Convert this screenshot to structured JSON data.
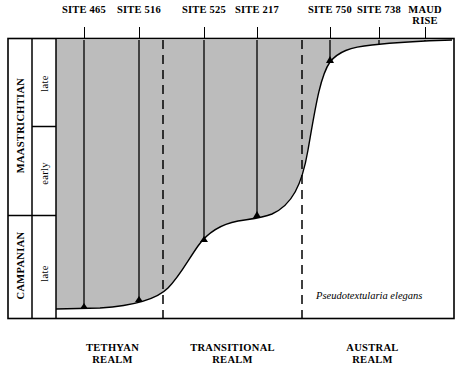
{
  "figure": {
    "sites": [
      {
        "label": "SITE\n465",
        "x": 84,
        "tick_x": 84
      },
      {
        "label": "SITE\n516",
        "x": 139,
        "tick_x": 139
      },
      {
        "label": "SITE\n525",
        "x": 204,
        "tick_x": 204
      },
      {
        "label": "SITE\n217",
        "x": 257,
        "tick_x": 257
      },
      {
        "label": "SITE\n750",
        "x": 330,
        "tick_x": 330
      },
      {
        "label": "SITE\n738",
        "x": 379,
        "tick_x": 379
      },
      {
        "label": "MAUD\nRISE",
        "x": 425,
        "tick_x": 425
      }
    ],
    "site_labels_flat": [
      "SITE 465",
      "SITE 516",
      "SITE 525",
      "SITE 217",
      "SITE 750",
      "SITE 738",
      "MAUD RISE"
    ],
    "stages": [
      {
        "name": "MAASTRICHTIAN",
        "substages": [
          "late",
          "early"
        ]
      },
      {
        "name": "CAMPANIAN",
        "substages": [
          "late"
        ]
      }
    ],
    "realms": [
      {
        "label": "TETHYAN\nREALM",
        "center_x": 115
      },
      {
        "label": "TRANSITIONAL\nREALM",
        "center_x": 228
      },
      {
        "label": "AUSTRAL\nREALM",
        "center_x": 372
      }
    ],
    "annotation": "Pseudotextularia elegans",
    "colors": {
      "fill": "#bcbcbc",
      "line": "#000000",
      "background": "#ffffff"
    }
  }
}
